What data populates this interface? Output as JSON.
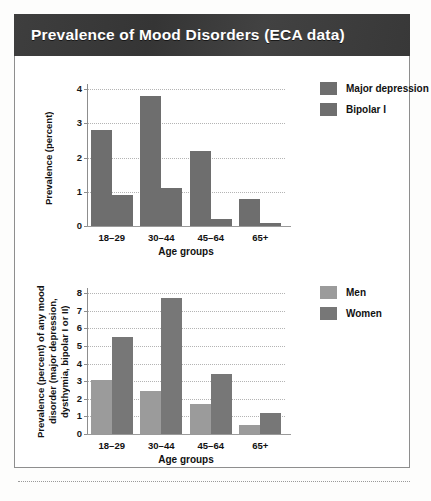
{
  "header": {
    "title": "Prevalence of Mood Disorders (ECA data)"
  },
  "chart_data": [
    {
      "id": "chart-1",
      "type": "bar",
      "title": "",
      "xlabel": "Age groups",
      "ylabel": "Prevalence (percent)",
      "categories": [
        "18–29",
        "30–44",
        "45–64",
        "65+"
      ],
      "yticks": [
        "0",
        "1",
        "2",
        "3",
        "4"
      ],
      "ylim": [
        0,
        4
      ],
      "grid": true,
      "legend_position": "right",
      "series": [
        {
          "name": "Major depression",
          "color": "#6e6e6e",
          "values": [
            2.8,
            3.8,
            2.2,
            0.8
          ]
        },
        {
          "name": "Bipolar I",
          "color": "#6e6e6e",
          "values": [
            0.9,
            1.1,
            0.2,
            0.1
          ]
        }
      ]
    },
    {
      "id": "chart-2",
      "type": "bar",
      "title": "",
      "xlabel": "Age groups",
      "ylabel": "Prevalence (percent) of any mood disorder (major depression, dysthymia, bipolar I or II)",
      "categories": [
        "18–29",
        "30–44",
        "45–64",
        "65+"
      ],
      "yticks": [
        "0",
        "1",
        "2",
        "3",
        "4",
        "5",
        "6",
        "7",
        "8"
      ],
      "ylim": [
        0,
        8
      ],
      "grid": true,
      "legend_position": "right",
      "series": [
        {
          "name": "Men",
          "color": "#9b9b9b",
          "values": [
            3.05,
            2.45,
            1.7,
            0.5
          ]
        },
        {
          "name": "Women",
          "color": "#777777",
          "values": [
            5.5,
            7.7,
            3.4,
            1.2
          ]
        }
      ]
    }
  ]
}
